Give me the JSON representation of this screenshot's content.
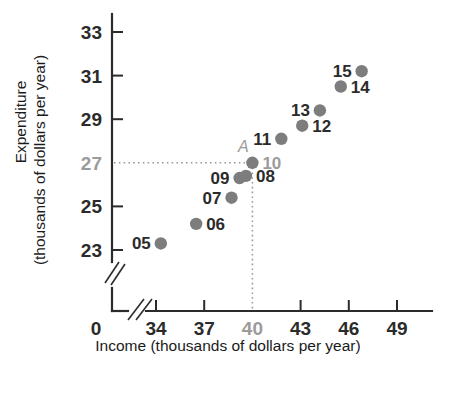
{
  "chart_data": {
    "type": "scatter",
    "title": "",
    "xlabel": "Income (thousands of dollars per year)",
    "ylabel": "Expenditure (thousands of dollars per year)",
    "ylabel_line1": "Expenditure",
    "ylabel_line2": "(thousands of dollars per year)",
    "xlim": [
      33,
      50
    ],
    "ylim": [
      22,
      34
    ],
    "axis_origin_label": "0",
    "x_axis_broken": true,
    "y_axis_broken": true,
    "grid": false,
    "legend": "none",
    "xticks": [
      34,
      37,
      40,
      43,
      46,
      49
    ],
    "xtick_labels": [
      "34",
      "37",
      "40",
      "43",
      "46",
      "49"
    ],
    "yticks": [
      23,
      25,
      27,
      29,
      31,
      33
    ],
    "ytick_labels": [
      "23",
      "25",
      "27",
      "29",
      "31",
      "33"
    ],
    "highlighted_xtick": "40",
    "highlighted_ytick": "27",
    "guide_lines": {
      "x": 40,
      "y": 27,
      "style": "dotted",
      "color": "#9b9b9b"
    },
    "annotation": {
      "label": "A",
      "x": 40,
      "y": 27,
      "style": "italic",
      "color": "#9b9b9b"
    },
    "marker_color": "#7d7d7d",
    "points": [
      {
        "label": "05",
        "x": 34.3,
        "y": 23.3,
        "label_pos": "left",
        "highlight": false
      },
      {
        "label": "06",
        "x": 36.5,
        "y": 24.2,
        "label_pos": "right",
        "highlight": false
      },
      {
        "label": "07",
        "x": 38.7,
        "y": 25.4,
        "label_pos": "left",
        "highlight": false
      },
      {
        "label": "08",
        "x": 39.6,
        "y": 26.4,
        "label_pos": "right",
        "highlight": false
      },
      {
        "label": "09",
        "x": 39.2,
        "y": 26.3,
        "label_pos": "left",
        "highlight": false
      },
      {
        "label": "10",
        "x": 40.0,
        "y": 27.0,
        "label_pos": "right",
        "highlight": true
      },
      {
        "label": "11",
        "x": 41.8,
        "y": 28.1,
        "label_pos": "left",
        "highlight": false
      },
      {
        "label": "12",
        "x": 43.1,
        "y": 28.7,
        "label_pos": "right",
        "highlight": false
      },
      {
        "label": "13",
        "x": 44.2,
        "y": 29.4,
        "label_pos": "left",
        "highlight": false
      },
      {
        "label": "14",
        "x": 45.5,
        "y": 30.5,
        "label_pos": "right",
        "highlight": false
      },
      {
        "label": "15",
        "x": 46.8,
        "y": 31.2,
        "label_pos": "left",
        "highlight": false
      }
    ]
  }
}
